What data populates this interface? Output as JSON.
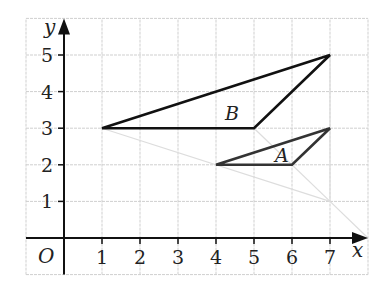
{
  "diagram": {
    "type": "coordinate-grid-enlargement",
    "axes": {
      "x_label": "x",
      "y_label": "y",
      "origin_label": "O",
      "x_ticks": [
        "1",
        "2",
        "3",
        "4",
        "5",
        "6",
        "7"
      ],
      "y_ticks": [
        "1",
        "2",
        "3",
        "4",
        "5"
      ],
      "x_range": [
        -1,
        8
      ],
      "y_range": [
        -1,
        6
      ]
    },
    "shapes": [
      {
        "name": "B",
        "label": "B",
        "vertices": [
          [
            1,
            3
          ],
          [
            5,
            3
          ],
          [
            7,
            5
          ]
        ],
        "color": "#111111"
      },
      {
        "name": "A",
        "label": "A",
        "vertices": [
          [
            4,
            2
          ],
          [
            6,
            2
          ],
          [
            7,
            3
          ]
        ],
        "color": "#333333"
      }
    ],
    "construction_lines": [
      {
        "from": [
          1,
          3
        ],
        "to": [
          7,
          1
        ]
      },
      {
        "from": [
          5,
          3
        ],
        "to": [
          7,
          1
        ]
      },
      {
        "from": [
          7,
          5
        ],
        "to": [
          7,
          1
        ]
      },
      {
        "from": [
          7,
          1
        ],
        "to": [
          8,
          0
        ]
      }
    ],
    "colors": {
      "grid": "#cfcfcf",
      "axis": "#111111",
      "construction": "#dddddd",
      "background": "#ffffff"
    }
  }
}
